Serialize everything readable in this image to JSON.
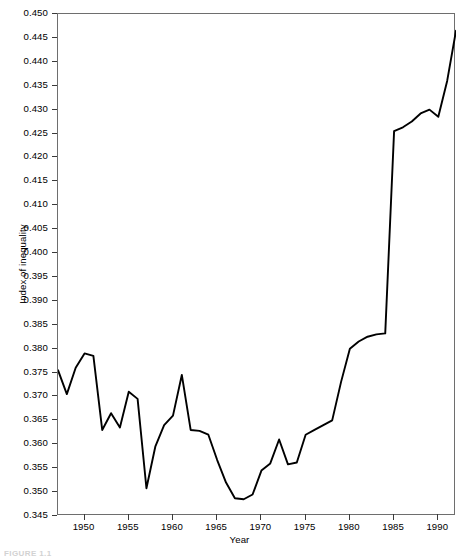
{
  "figure": {
    "caption": "FIGURE 1.1"
  },
  "chart_data": {
    "type": "line",
    "title": "",
    "xlabel": "Year",
    "ylabel": "Index of inequality",
    "xlim": [
      1947,
      1992
    ],
    "ylim": [
      0.345,
      0.45
    ],
    "grid": false,
    "legend": null,
    "xticks": [
      1950,
      1955,
      1960,
      1965,
      1970,
      1975,
      1980,
      1985,
      1990
    ],
    "xtick_labels": [
      "1950",
      "1955",
      "1960",
      "1965",
      "1970",
      "1975",
      "1980",
      "1985",
      "1990"
    ],
    "yticks": [
      0.345,
      0.35,
      0.355,
      0.36,
      0.365,
      0.37,
      0.375,
      0.38,
      0.385,
      0.39,
      0.395,
      0.4,
      0.405,
      0.41,
      0.415,
      0.42,
      0.425,
      0.43,
      0.435,
      0.44,
      0.445,
      0.45
    ],
    "ytick_labels": [
      "0.345",
      "0.350",
      "0.355",
      "0.360",
      "0.365",
      "0.370",
      "0.375",
      "0.380",
      "0.385",
      "0.390",
      "0.395",
      "0.400",
      "0.405",
      "0.410",
      "0.415",
      "0.420",
      "0.425",
      "0.430",
      "0.435",
      "0.440",
      "0.445",
      "0.450"
    ],
    "line_color": "#000000",
    "line_width": 1.9,
    "x": [
      1947,
      1948,
      1949,
      1950,
      1951,
      1952,
      1953,
      1954,
      1955,
      1956,
      1957,
      1958,
      1959,
      1960,
      1961,
      1962,
      1963,
      1964,
      1965,
      1966,
      1967,
      1968,
      1969,
      1970,
      1971,
      1972,
      1973,
      1974,
      1975,
      1976,
      1977,
      1978,
      1979,
      1980,
      1981,
      1982,
      1983,
      1984,
      1985,
      1986,
      1987,
      1988,
      1989,
      1990,
      1991,
      1992
    ],
    "values": [
      0.3755,
      0.3705,
      0.376,
      0.379,
      0.3785,
      0.363,
      0.3665,
      0.3635,
      0.371,
      0.3695,
      0.3508,
      0.3595,
      0.364,
      0.366,
      0.3745,
      0.363,
      0.3628,
      0.362,
      0.3567,
      0.352,
      0.3487,
      0.3485,
      0.3495,
      0.3545,
      0.356,
      0.361,
      0.3558,
      0.3562,
      0.362,
      0.363,
      0.364,
      0.365,
      0.373,
      0.38,
      0.3815,
      0.3825,
      0.383,
      0.3832,
      0.4255,
      0.4263,
      0.4275,
      0.4292,
      0.43,
      0.4285,
      0.436,
      0.4465
    ],
    "series": [
      {
        "name": "Index of inequality",
        "values": [
          0.3755,
          0.3705,
          0.376,
          0.379,
          0.3785,
          0.363,
          0.3665,
          0.3635,
          0.371,
          0.3695,
          0.3508,
          0.3595,
          0.364,
          0.366,
          0.3745,
          0.363,
          0.3628,
          0.362,
          0.3567,
          0.352,
          0.3487,
          0.3485,
          0.3495,
          0.3545,
          0.356,
          0.361,
          0.3558,
          0.3562,
          0.362,
          0.363,
          0.364,
          0.365,
          0.373,
          0.38,
          0.3815,
          0.3825,
          0.383,
          0.3832,
          0.4255,
          0.4263,
          0.4275,
          0.4292,
          0.43,
          0.4285,
          0.436,
          0.4465
        ]
      }
    ]
  }
}
